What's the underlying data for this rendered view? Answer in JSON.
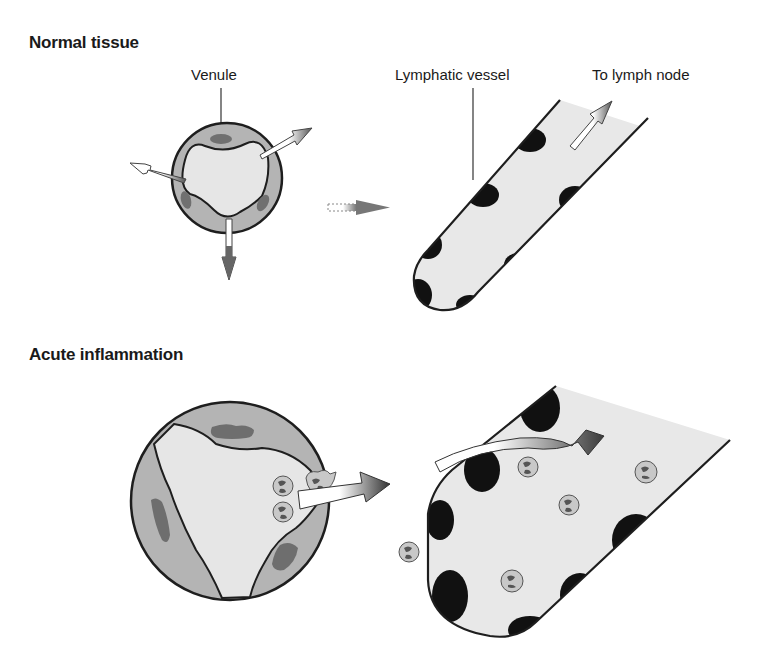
{
  "panels": [
    {
      "heading": "Normal tissue",
      "labels": {
        "venule": "Venule",
        "lymphatic_vessel": "Lymphatic vessel",
        "to_lymph_node": "To lymph node"
      }
    },
    {
      "heading": "Acute inflammation"
    }
  ],
  "colors": {
    "vessel_wall": "#b4b4b4",
    "lumen": "#e6e6e6",
    "nucleus": "#6e6e6e",
    "outline": "#1e1e1e",
    "lymph_fill": "#e8e8e8",
    "lymph_cell": "#111111",
    "arrow_dark": "#3c3c3c"
  }
}
